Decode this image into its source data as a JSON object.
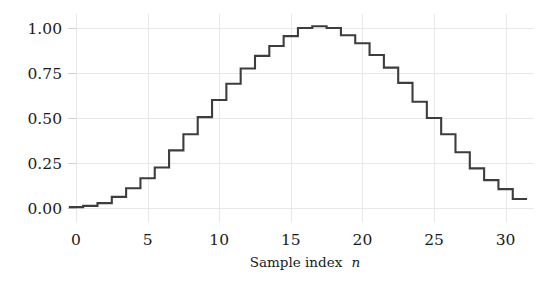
{
  "chart_data": {
    "type": "line",
    "style": "step-post",
    "title": "",
    "subtitle": "",
    "xlabel_prefix": "Sample index",
    "xlabel_symbol": "n",
    "xlabel": "Sample index n",
    "ylabel": "",
    "xlim": [
      -0.6,
      31.6
    ],
    "ylim": [
      -0.06,
      1.09
    ],
    "grid": true,
    "grid_axis": "both",
    "legend": null,
    "legend_position": "none",
    "line_color": "#3d3d3d",
    "grid_color": "#e8e8e8",
    "background_color": "#ffffff",
    "xticks": [
      0,
      5,
      10,
      15,
      20,
      25,
      30
    ],
    "xtick_labels": [
      "0",
      "5",
      "10",
      "15",
      "20",
      "25",
      "30"
    ],
    "yticks": [
      0.0,
      0.25,
      0.5,
      0.75,
      1.0
    ],
    "ytick_labels": [
      "0.00",
      "0.25",
      "0.50",
      "0.75",
      "1.00"
    ],
    "x": [
      0,
      1,
      2,
      3,
      4,
      5,
      6,
      7,
      8,
      9,
      10,
      11,
      12,
      13,
      14,
      15,
      16,
      17,
      18,
      19,
      20,
      21,
      22,
      23,
      24,
      25,
      26,
      27,
      28,
      29,
      30,
      31
    ],
    "values": [
      0.005,
      0.012,
      0.027,
      0.062,
      0.11,
      0.165,
      0.225,
      0.32,
      0.41,
      0.505,
      0.6,
      0.69,
      0.775,
      0.845,
      0.9,
      0.955,
      1.0,
      1.01,
      1.0,
      0.96,
      0.915,
      0.85,
      0.78,
      0.695,
      0.59,
      0.5,
      0.41,
      0.31,
      0.22,
      0.155,
      0.105,
      0.05
    ]
  },
  "figure": {
    "plot_left": 76,
    "plot_right": 534,
    "plot_top": 14,
    "plot_bottom": 222,
    "y_zero_px": 208,
    "y_one_px": 28,
    "x_zero_px": 76,
    "x_unit_px": 14.32
  }
}
